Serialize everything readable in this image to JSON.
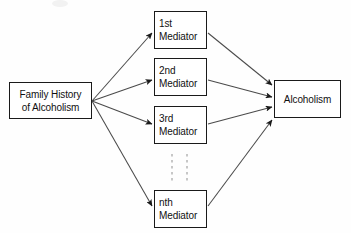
{
  "diagram": {
    "background_color": "#ffffff",
    "stroke_color": "#1a1a1a",
    "text_color": "#111111",
    "nodes": {
      "family_history": {
        "line1": "Family History",
        "line2": "of Alcoholism"
      },
      "mediator_1": {
        "line1": "1st",
        "line2": "Mediator"
      },
      "mediator_2": {
        "line1": "2nd",
        "line2": "Mediator"
      },
      "mediator_3": {
        "line1": "3rd",
        "line2": "Mediator"
      },
      "mediator_n": {
        "line1": "nth",
        "line2": "Mediator"
      },
      "outcome": {
        "line1": "Alcoholism"
      }
    },
    "ellipsis": {
      "symbol": "vertical-dashed-lines",
      "count": 2
    },
    "edges": [
      {
        "from": "family_history",
        "to": "mediator_1"
      },
      {
        "from": "family_history",
        "to": "mediator_2"
      },
      {
        "from": "family_history",
        "to": "mediator_3"
      },
      {
        "from": "family_history",
        "to": "mediator_n"
      },
      {
        "from": "mediator_1",
        "to": "outcome"
      },
      {
        "from": "mediator_2",
        "to": "outcome"
      },
      {
        "from": "mediator_3",
        "to": "outcome"
      },
      {
        "from": "mediator_n",
        "to": "outcome"
      }
    ]
  }
}
